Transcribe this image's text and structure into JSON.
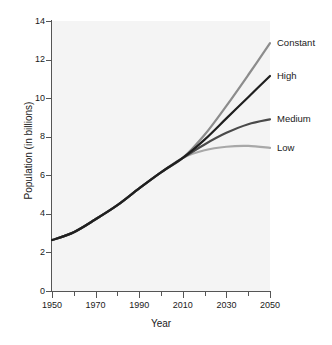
{
  "chart_data": {
    "type": "line",
    "title": "",
    "xlabel": "Year",
    "ylabel": "Population (in billions)",
    "xlim": [
      1950,
      2050
    ],
    "ylim": [
      0,
      14
    ],
    "grid": false,
    "legend_position": "right-inline-end-labels",
    "x_ticks_major": [
      1950,
      1970,
      1990,
      2010,
      2030,
      2050
    ],
    "x_ticks_minor": [
      1960,
      1980,
      2000,
      2020,
      2040
    ],
    "x_tick_labels": [
      "1950",
      "1970",
      "1990",
      "2010",
      "2030",
      "2050"
    ],
    "y_ticks": [
      0,
      2,
      4,
      6,
      8,
      10,
      12,
      14
    ],
    "y_tick_labels": [
      "0",
      "2",
      "4",
      "6",
      "8",
      "10",
      "12",
      "14"
    ],
    "x": [
      1950,
      1960,
      1970,
      1980,
      1990,
      2000,
      2010,
      2020,
      2030,
      2040,
      2050
    ],
    "series": [
      {
        "name": "Constant",
        "color": "#8c8c8c",
        "values": [
          2.64,
          3.05,
          3.72,
          4.45,
          5.32,
          6.15,
          6.9,
          8.1,
          9.6,
          11.2,
          12.85
        ]
      },
      {
        "name": "High",
        "color": "#1f1f1f",
        "values": [
          2.64,
          3.05,
          3.72,
          4.45,
          5.32,
          6.15,
          6.9,
          7.85,
          8.95,
          10.05,
          11.15
        ]
      },
      {
        "name": "Medium",
        "color": "#4a4a4a",
        "values": [
          2.64,
          3.05,
          3.72,
          4.45,
          5.32,
          6.15,
          6.9,
          7.6,
          8.2,
          8.65,
          8.9
        ]
      },
      {
        "name": "Low",
        "color": "#a8a8a8",
        "values": [
          2.64,
          3.05,
          3.72,
          4.45,
          5.32,
          6.15,
          6.9,
          7.3,
          7.48,
          7.52,
          7.42
        ]
      }
    ]
  },
  "axis": {
    "xlabel": "Year",
    "ylabel": "Population (in billions)"
  },
  "series_labels": [
    {
      "label": "Constant"
    },
    {
      "label": "High"
    },
    {
      "label": "Medium"
    },
    {
      "label": "Low"
    }
  ],
  "y_tick_labels": [
    "14",
    "12",
    "10",
    "8",
    "6",
    "4",
    "2",
    "0"
  ],
  "x_tick_labels": [
    "1950",
    "1970",
    "1990",
    "2010",
    "2030",
    "2050"
  ],
  "colors": {
    "plot_background": "#f4f4f4",
    "page_background": "#ffffff",
    "axis": "#555555",
    "text": "#1a1a1a",
    "constant": "#8c8c8c",
    "high": "#1f1f1f",
    "medium": "#4a4a4a",
    "low": "#a8a8a8"
  }
}
